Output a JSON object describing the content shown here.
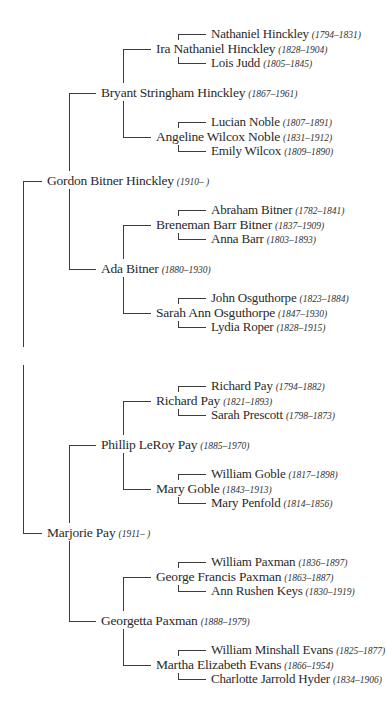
{
  "colors": {
    "line": "#3c3c3c",
    "text": "#2a2a2a",
    "background": "#ffffff"
  },
  "people": [
    {
      "id": "nathaniel_hinckley",
      "name": "Nathaniel Hinckley",
      "dates": "(1794–1831)",
      "level": 4,
      "y": 34
    },
    {
      "id": "ira_nathaniel_hinckley",
      "name": "Ira Nathaniel Hinckley",
      "dates": "(1828–1904)",
      "level": 3,
      "y": 49
    },
    {
      "id": "lois_judd",
      "name": "Lois Judd",
      "dates": "(1805–1845)",
      "level": 4,
      "y": 63
    },
    {
      "id": "bryant_stringham_hinckley",
      "name": "Bryant Stringham Hinckley",
      "dates": "(1867–1961)",
      "level": 2,
      "y": 93
    },
    {
      "id": "lucian_noble",
      "name": "Lucian Noble",
      "dates": "(1807–1891)",
      "level": 4,
      "y": 122
    },
    {
      "id": "angeline_wilcox_noble",
      "name": "Angeline Wilcox Noble",
      "dates": "(1831–1912)",
      "level": 3,
      "y": 137
    },
    {
      "id": "emily_wilcox",
      "name": "Emily Wilcox",
      "dates": "(1809–1890)",
      "level": 4,
      "y": 151
    },
    {
      "id": "gordon_bitner_hinckley",
      "name": "Gordon Bitner Hinckley",
      "dates": "(1910–     )",
      "level": 1,
      "y": 181
    },
    {
      "id": "abraham_bitner",
      "name": "Abraham Bitner",
      "dates": "(1782–1841)",
      "level": 4,
      "y": 210
    },
    {
      "id": "breneman_barr_bitner",
      "name": "Breneman Barr Bitner",
      "dates": "(1837–1909)",
      "level": 3,
      "y": 225
    },
    {
      "id": "anna_barr",
      "name": "Anna Barr",
      "dates": "(1803–1893)",
      "level": 4,
      "y": 239
    },
    {
      "id": "ada_bitner",
      "name": "Ada Bitner",
      "dates": "(1880–1930)",
      "level": 2,
      "y": 269
    },
    {
      "id": "john_osguthorpe",
      "name": "John Osguthorpe",
      "dates": "(1823–1884)",
      "level": 4,
      "y": 298
    },
    {
      "id": "sarah_ann_osguthorpe",
      "name": "Sarah Ann Osguthorpe",
      "dates": "(1847–1930)",
      "level": 3,
      "y": 313
    },
    {
      "id": "lydia_roper",
      "name": "Lydia Roper",
      "dates": "(1828–1915)",
      "level": 4,
      "y": 327
    },
    {
      "id": "richard_pay_1794",
      "name": "Richard Pay",
      "dates": "(1794–1882)",
      "level": 4,
      "y": 386
    },
    {
      "id": "richard_pay_1821",
      "name": "Richard Pay",
      "dates": "(1821–1893)",
      "level": 3,
      "y": 401
    },
    {
      "id": "sarah_prescott",
      "name": "Sarah Prescott",
      "dates": "(1798–1873)",
      "level": 4,
      "y": 415
    },
    {
      "id": "phillip_leroy_pay",
      "name": "Phillip LeRoy Pay",
      "dates": "(1885–1970)",
      "level": 2,
      "y": 445
    },
    {
      "id": "william_goble",
      "name": "William Goble",
      "dates": "(1817–1898)",
      "level": 4,
      "y": 474
    },
    {
      "id": "mary_goble",
      "name": "Mary Goble",
      "dates": "(1843–1913)",
      "level": 3,
      "y": 489
    },
    {
      "id": "mary_penfold",
      "name": "Mary Penfold",
      "dates": "(1814–1856)",
      "level": 4,
      "y": 503
    },
    {
      "id": "marjorie_pay",
      "name": "Marjorie Pay",
      "dates": "(1911–     )",
      "level": 1,
      "y": 533
    },
    {
      "id": "william_paxman",
      "name": "William Paxman",
      "dates": "(1836–1897)",
      "level": 4,
      "y": 562
    },
    {
      "id": "george_francis_paxman",
      "name": "George Francis Paxman",
      "dates": "(1863–1887)",
      "level": 3,
      "y": 577
    },
    {
      "id": "ann_rushen_keys",
      "name": "Ann Rushen Keys",
      "dates": "(1830–1919)",
      "level": 4,
      "y": 591
    },
    {
      "id": "georgetta_paxman",
      "name": "Georgetta Paxman",
      "dates": "(1888–1979)",
      "level": 2,
      "y": 621
    },
    {
      "id": "william_minshall_evans",
      "name": "William Minshall Evans",
      "dates": "(1825–1877)",
      "level": 4,
      "y": 650
    },
    {
      "id": "martha_elizabeth_evans",
      "name": "Martha Elizabeth Evans",
      "dates": "(1866–1954)",
      "level": 3,
      "y": 665
    },
    {
      "id": "charlotte_jarrold_hyder",
      "name": "Charlotte Jarrold Hyder",
      "dates": "(1834–1906)",
      "level": 4,
      "y": 679
    }
  ],
  "couples": [
    {
      "level": 1,
      "top": "gordon_bitner_hinckley",
      "bottom": "marjorie_pay"
    },
    {
      "level": 2,
      "top": "bryant_stringham_hinckley",
      "bottom": "ada_bitner"
    },
    {
      "level": 2,
      "top": "phillip_leroy_pay",
      "bottom": "georgetta_paxman"
    },
    {
      "level": 3,
      "top": "ira_nathaniel_hinckley",
      "bottom": "angeline_wilcox_noble"
    },
    {
      "level": 3,
      "top": "breneman_barr_bitner",
      "bottom": "sarah_ann_osguthorpe"
    },
    {
      "level": 3,
      "top": "richard_pay_1821",
      "bottom": "mary_goble"
    },
    {
      "level": 3,
      "top": "george_francis_paxman",
      "bottom": "martha_elizabeth_evans"
    },
    {
      "level": 4,
      "top": "nathaniel_hinckley",
      "bottom": "lois_judd"
    },
    {
      "level": 4,
      "top": "lucian_noble",
      "bottom": "emily_wilcox"
    },
    {
      "level": 4,
      "top": "abraham_bitner",
      "bottom": "anna_barr"
    },
    {
      "level": 4,
      "top": "john_osguthorpe",
      "bottom": "lydia_roper"
    },
    {
      "level": 4,
      "top": "richard_pay_1794",
      "bottom": "sarah_prescott"
    },
    {
      "level": 4,
      "top": "william_goble",
      "bottom": "mary_penfold"
    },
    {
      "level": 4,
      "top": "william_paxman",
      "bottom": "ann_rushen_keys"
    },
    {
      "level": 4,
      "top": "william_minshall_evans",
      "bottom": "charlotte_jarrold_hyder"
    }
  ]
}
